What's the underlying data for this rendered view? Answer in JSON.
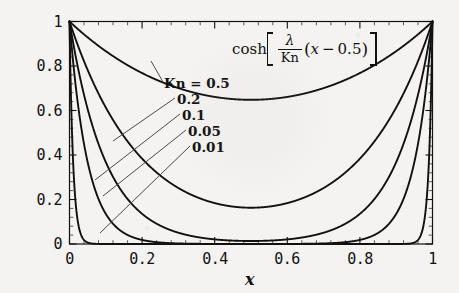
{
  "figure": {
    "formula": {
      "function_name": "cosh",
      "bracket_open": "[",
      "numerator": "λ",
      "denominator": "Kn",
      "factor": "(x − 0.5)",
      "paren_open": "(",
      "variable": "x",
      "minus": "−",
      "offset": "0.5",
      "paren_close": ")",
      "bracket_close": "]",
      "plain": "cosh[(λ/Kn)(x − 0.5)]"
    },
    "x_axis_title": "x",
    "background_color": "#f4f3f1",
    "curve_color": "#111111",
    "leader_color": "#5b5b5b"
  },
  "chart_data": {
    "type": "line",
    "title": "",
    "subtitle": "",
    "annotations": [
      {
        "text": "cosh[(λ/Kn)(x − 0.5)]",
        "x": 0.62,
        "y": 0.93
      }
    ],
    "xlabel": "x",
    "ylabel": "",
    "xlim": [
      0,
      1
    ],
    "ylim": [
      0,
      1
    ],
    "xticks": [
      0,
      0.2,
      0.4,
      0.6,
      0.8,
      1
    ],
    "xticklabels": [
      "0",
      "0.2",
      "0.4",
      "0.6",
      "0.8",
      "1"
    ],
    "yticks": [
      0,
      0.2,
      0.4,
      0.6,
      0.8,
      1
    ],
    "yticklabels": [
      "0",
      "0.2",
      "0.4",
      "0.6",
      "0.8",
      "1"
    ],
    "minor_ticks": true,
    "grid": false,
    "frame": true,
    "legend": "inline-leader-labels",
    "legend_prefix": "Kn = ",
    "series": [
      {
        "name": "Kn = 0.5",
        "label": "Kn = 0.5",
        "kn": 0.5,
        "min_value": 0.74,
        "x": [
          0,
          0.05,
          0.1,
          0.15,
          0.2,
          0.25,
          0.3,
          0.35,
          0.4,
          0.45,
          0.5,
          0.55,
          0.6,
          0.65,
          0.7,
          0.75,
          0.8,
          0.85,
          0.9,
          0.95,
          1
        ],
        "values": [
          1,
          0.9749,
          0.9019,
          0.8835,
          0.8395,
          0.8046,
          0.7792,
          0.7632,
          0.7567,
          0.7567,
          0.7404,
          0.7567,
          0.7567,
          0.7632,
          0.7792,
          0.8046,
          0.8395,
          0.8835,
          0.9019,
          0.9749,
          1
        ]
      },
      {
        "name": "0.2",
        "label": "0.2",
        "kn": 0.2,
        "min_value": 0.25,
        "x": [
          0,
          0.05,
          0.1,
          0.15,
          0.2,
          0.25,
          0.3,
          0.35,
          0.4,
          0.45,
          0.5,
          0.55,
          0.6,
          0.65,
          0.7,
          0.75,
          0.8,
          0.85,
          0.9,
          0.95,
          1
        ],
        "values": [
          1,
          0.8011,
          0.6455,
          0.5252,
          0.4346,
          0.3686,
          0.3231,
          0.2944,
          0.2797,
          0.2764,
          0.2764,
          0.2764,
          0.2797,
          0.2944,
          0.3231,
          0.3686,
          0.4346,
          0.5252,
          0.6455,
          0.8011,
          1
        ]
      },
      {
        "name": "0.1",
        "label": "0.1",
        "kn": 0.1,
        "min_value": 0.04,
        "x": [
          0,
          0.05,
          0.1,
          0.15,
          0.2,
          0.25,
          0.3,
          0.35,
          0.4,
          0.45,
          0.5,
          0.55,
          0.6,
          0.65,
          0.7,
          0.75,
          0.8,
          0.85,
          0.9,
          0.95,
          1
        ],
        "values": [
          1,
          0.6106,
          0.3737,
          0.23,
          0.1431,
          0.0913,
          0.0616,
          0.0457,
          0.0387,
          0.037,
          0.037,
          0.037,
          0.0387,
          0.0457,
          0.0616,
          0.0913,
          0.1431,
          0.23,
          0.3737,
          0.6106,
          1
        ]
      },
      {
        "name": "0.05",
        "label": "0.05",
        "kn": 0.05,
        "min_value": 0.003,
        "x": [
          0,
          0.025,
          0.05,
          0.075,
          0.1,
          0.15,
          0.2,
          0.25,
          0.3,
          0.35,
          0.4,
          0.45,
          0.5,
          0.55,
          0.6,
          0.65,
          0.7,
          0.75,
          0.8,
          0.85,
          0.9,
          0.925,
          0.95,
          0.975,
          1
        ],
        "values": [
          1,
          0.6067,
          0.3682,
          0.2236,
          0.136,
          0.0505,
          0.019,
          0.0074,
          0.0032,
          0.0018,
          0.0014,
          0.0013,
          0.0013,
          0.0013,
          0.0014,
          0.0018,
          0.0032,
          0.0074,
          0.019,
          0.0505,
          0.136,
          0.2236,
          0.3682,
          0.6067,
          1
        ]
      },
      {
        "name": "0.01",
        "label": "0.01",
        "kn": 0.01,
        "min_value": 0.0,
        "x": [
          0,
          0.005,
          0.01,
          0.015,
          0.02,
          0.03,
          0.04,
          0.05,
          0.1,
          0.2,
          0.3,
          0.4,
          0.5,
          0.6,
          0.7,
          0.8,
          0.9,
          0.95,
          0.97,
          0.98,
          0.985,
          0.99,
          0.995,
          1
        ],
        "values": [
          1,
          0.6065,
          0.3679,
          0.2231,
          0.1353,
          0.0498,
          0.0183,
          0.0067,
          0.0,
          0.0,
          0.0,
          0.0,
          0.0,
          0.0,
          0.0,
          0.0,
          0.0,
          0.0,
          0.0,
          0.0,
          0.0067,
          0.0498,
          0.2231,
          1
        ]
      }
    ]
  },
  "labels": {
    "kn_05": "Kn = 0.5",
    "kn_02": "0.2",
    "kn_01": "0.1",
    "kn_005": "0.05",
    "kn_001": "0.01"
  },
  "y_tick_labels": [
    "1",
    "0.8",
    "0.6",
    "0.4",
    "0.2",
    "0"
  ],
  "x_tick_labels": [
    "0",
    "0.2",
    "0.4",
    "0.6",
    "0.8",
    "1"
  ]
}
